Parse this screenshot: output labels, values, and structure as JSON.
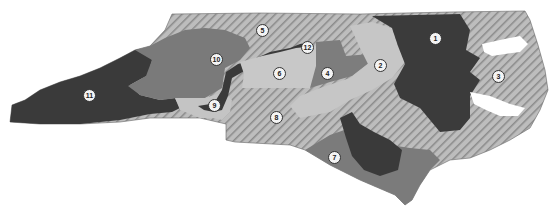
{
  "map": {
    "title": "North Carolina congressional districts",
    "colors": {
      "dark": "#3a3a3a",
      "medium": "#7d7d7d",
      "light": "#c2c2c2",
      "hatch_bg": "#b8b8b8",
      "hatch_line": "#8a8a8a",
      "background": "#ffffff"
    },
    "districts": [
      {
        "id": "1",
        "label": "1",
        "x": 435,
        "y": 38,
        "style": "dark"
      },
      {
        "id": "2",
        "label": "2",
        "x": 380,
        "y": 65,
        "style": "light"
      },
      {
        "id": "3",
        "label": "3",
        "x": 498,
        "y": 76,
        "style": "hatched"
      },
      {
        "id": "4",
        "label": "4",
        "x": 327,
        "y": 73,
        "style": "medium"
      },
      {
        "id": "5",
        "label": "5",
        "x": 262,
        "y": 30,
        "style": "hatched"
      },
      {
        "id": "6",
        "label": "6",
        "x": 279,
        "y": 73,
        "style": "light"
      },
      {
        "id": "7",
        "label": "7",
        "x": 334,
        "y": 157,
        "style": "medium"
      },
      {
        "id": "8",
        "label": "8",
        "x": 276,
        "y": 117,
        "style": "hatched"
      },
      {
        "id": "9",
        "label": "9",
        "x": 214,
        "y": 105,
        "style": "light"
      },
      {
        "id": "10",
        "label": "10",
        "x": 216,
        "y": 59,
        "style": "medium"
      },
      {
        "id": "11",
        "label": "11",
        "x": 89,
        "y": 95,
        "style": "dark"
      },
      {
        "id": "12",
        "label": "12",
        "x": 307,
        "y": 47,
        "style": "dark"
      }
    ]
  }
}
